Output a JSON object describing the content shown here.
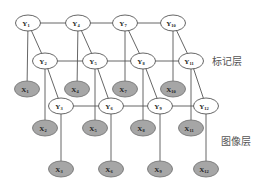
{
  "title": "",
  "layer_labels": {
    "label_layer": "标记层",
    "image_layer": "图像层"
  },
  "colors": {
    "label_node_fill": "#ffffff",
    "observed_node_fill": "#a6a6a6",
    "edge": "#555555"
  },
  "nodes": [
    {
      "id": "Y1",
      "letter": "Y",
      "sub": "1",
      "type": "label"
    },
    {
      "id": "Y2",
      "letter": "Y",
      "sub": "2",
      "type": "label"
    },
    {
      "id": "Y3",
      "letter": "Y",
      "sub": "3",
      "type": "label"
    },
    {
      "id": "Y4",
      "letter": "Y",
      "sub": "4",
      "type": "label"
    },
    {
      "id": "Y5",
      "letter": "Y",
      "sub": "5",
      "type": "label"
    },
    {
      "id": "Y6",
      "letter": "Y",
      "sub": "6",
      "type": "label"
    },
    {
      "id": "Y7",
      "letter": "Y",
      "sub": "7",
      "type": "label"
    },
    {
      "id": "Y8",
      "letter": "Y",
      "sub": "8",
      "type": "label"
    },
    {
      "id": "Y9",
      "letter": "Y",
      "sub": "9",
      "type": "label"
    },
    {
      "id": "Y10",
      "letter": "Y",
      "sub": "10",
      "type": "label"
    },
    {
      "id": "Y11",
      "letter": "Y",
      "sub": "11",
      "type": "label"
    },
    {
      "id": "Y12",
      "letter": "Y",
      "sub": "12",
      "type": "label"
    },
    {
      "id": "X1",
      "letter": "X",
      "sub": "1",
      "type": "observed"
    },
    {
      "id": "X2",
      "letter": "X",
      "sub": "2",
      "type": "observed"
    },
    {
      "id": "X3",
      "letter": "X",
      "sub": "3",
      "type": "observed"
    },
    {
      "id": "X4",
      "letter": "X",
      "sub": "4",
      "type": "observed"
    },
    {
      "id": "X5",
      "letter": "X",
      "sub": "5",
      "type": "observed"
    },
    {
      "id": "X6",
      "letter": "X",
      "sub": "6",
      "type": "observed"
    },
    {
      "id": "X7",
      "letter": "X",
      "sub": "7",
      "type": "observed"
    },
    {
      "id": "X8",
      "letter": "X",
      "sub": "8",
      "type": "observed"
    },
    {
      "id": "X9",
      "letter": "X",
      "sub": "9",
      "type": "observed"
    },
    {
      "id": "X10",
      "letter": "X",
      "sub": "10",
      "type": "observed"
    },
    {
      "id": "X11",
      "letter": "X",
      "sub": "11",
      "type": "observed"
    },
    {
      "id": "X12",
      "letter": "X",
      "sub": "12",
      "type": "observed"
    }
  ],
  "edges": [
    [
      "Y1",
      "Y4"
    ],
    [
      "Y4",
      "Y7"
    ],
    [
      "Y7",
      "Y10"
    ],
    [
      "Y2",
      "Y5"
    ],
    [
      "Y5",
      "Y8"
    ],
    [
      "Y8",
      "Y11"
    ],
    [
      "Y3",
      "Y6"
    ],
    [
      "Y6",
      "Y9"
    ],
    [
      "Y9",
      "Y12"
    ],
    [
      "Y1",
      "Y2"
    ],
    [
      "Y2",
      "Y3"
    ],
    [
      "Y4",
      "Y5"
    ],
    [
      "Y5",
      "Y6"
    ],
    [
      "Y7",
      "Y8"
    ],
    [
      "Y8",
      "Y9"
    ],
    [
      "Y10",
      "Y11"
    ],
    [
      "Y11",
      "Y12"
    ],
    [
      "Y1",
      "X1"
    ],
    [
      "Y2",
      "X2"
    ],
    [
      "Y3",
      "X3"
    ],
    [
      "Y4",
      "X4"
    ],
    [
      "Y5",
      "X5"
    ],
    [
      "Y6",
      "X6"
    ],
    [
      "Y7",
      "X7"
    ],
    [
      "Y8",
      "X8"
    ],
    [
      "Y9",
      "X9"
    ],
    [
      "Y10",
      "X10"
    ],
    [
      "Y11",
      "X11"
    ],
    [
      "Y12",
      "X12"
    ]
  ]
}
